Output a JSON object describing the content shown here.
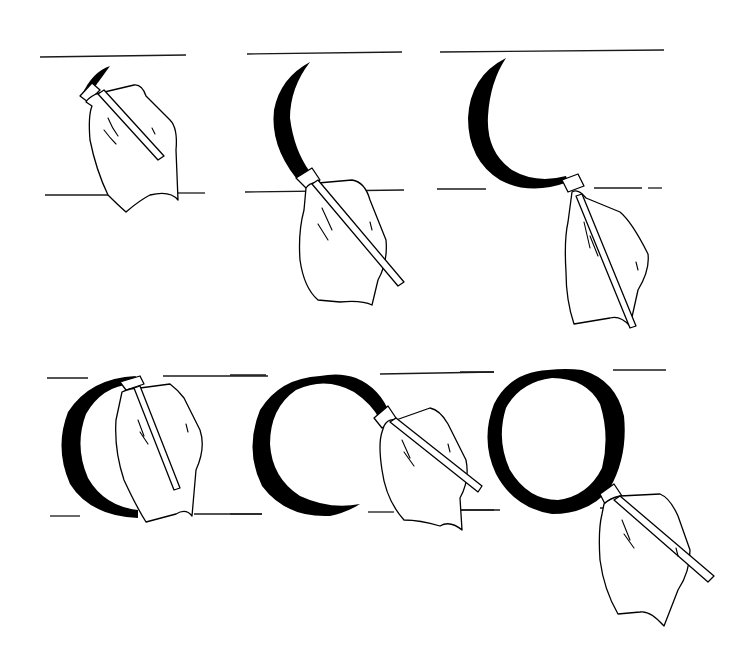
{
  "illustration": {
    "subject": "broad-edged pen calligraphy: construction of the letter O",
    "background_color": "#ffffff",
    "ink_color": "#000000",
    "rows": [
      {
        "panels": [
          {
            "step": 1,
            "description": "pen nib placed at top-left, initial stroke mark"
          },
          {
            "step": 2,
            "description": "left crescent stroke drawn down to baseline"
          },
          {
            "step": 3,
            "description": "left stroke curved along baseline to bottom"
          }
        ]
      },
      {
        "panels": [
          {
            "step": 4,
            "description": "pen repositioned at top for second stroke"
          },
          {
            "step": 5,
            "description": "right stroke drawn over top and down right side"
          },
          {
            "step": 6,
            "description": "completed letter O"
          }
        ]
      }
    ]
  }
}
